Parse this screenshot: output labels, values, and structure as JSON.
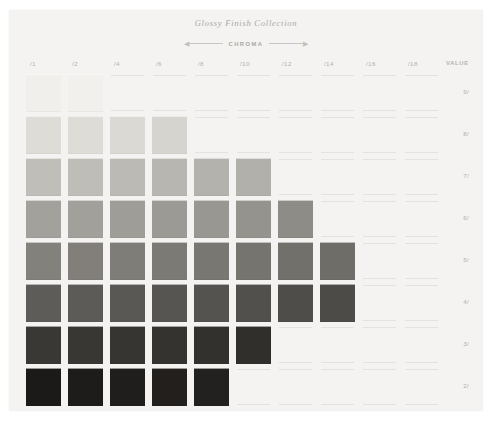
{
  "card": {
    "background": "#f4f3f1",
    "title": "Glossy Finish Collection"
  },
  "axis": {
    "chroma_label": "CHROMA",
    "arrow_left": "◀",
    "arrow_right": "▶"
  },
  "headers": {
    "value_header": "VALUE",
    "chroma_columns": [
      "/1",
      "/2",
      "/4",
      "/6",
      "/8",
      "/10",
      "/12",
      "/14",
      "/16",
      "/18"
    ]
  },
  "value_labels": [
    "9/",
    "8/",
    "7/",
    "6/",
    "5/",
    "4/",
    "3/",
    "2/"
  ],
  "chart_data": {
    "type": "heatmap",
    "title": "Glossy Finish Collection",
    "xlabel": "CHROMA",
    "ylabel": "VALUE",
    "categories": [
      "/1",
      "/2",
      "/4",
      "/6",
      "/8",
      "/10",
      "/12",
      "/14",
      "/16",
      "/18"
    ],
    "rows": [
      "9/",
      "8/",
      "7/",
      "6/",
      "5/",
      "4/",
      "3/",
      "2/"
    ],
    "grid": false,
    "legend": "none",
    "cells": [
      {
        "row": "9/",
        "col": "/1",
        "color": "#f0efeb"
      },
      {
        "row": "9/",
        "col": "/2",
        "color": "#f1f0ec"
      },
      {
        "row": "9/",
        "col": "/4",
        "color": null
      },
      {
        "row": "9/",
        "col": "/6",
        "color": null
      },
      {
        "row": "9/",
        "col": "/8",
        "color": null
      },
      {
        "row": "9/",
        "col": "/10",
        "color": null
      },
      {
        "row": "9/",
        "col": "/12",
        "color": null
      },
      {
        "row": "9/",
        "col": "/14",
        "color": null
      },
      {
        "row": "9/",
        "col": "/16",
        "color": null
      },
      {
        "row": "9/",
        "col": "/18",
        "color": null
      },
      {
        "row": "8/",
        "col": "/1",
        "color": "#dedcd7"
      },
      {
        "row": "8/",
        "col": "/2",
        "color": "#dedcd7"
      },
      {
        "row": "8/",
        "col": "/4",
        "color": "#dbd9d4"
      },
      {
        "row": "8/",
        "col": "/6",
        "color": "#d6d4cf"
      },
      {
        "row": "8/",
        "col": "/8",
        "color": null
      },
      {
        "row": "8/",
        "col": "/10",
        "color": null
      },
      {
        "row": "8/",
        "col": "/12",
        "color": null
      },
      {
        "row": "8/",
        "col": "/14",
        "color": null
      },
      {
        "row": "8/",
        "col": "/16",
        "color": null
      },
      {
        "row": "8/",
        "col": "/18",
        "color": null
      },
      {
        "row": "7/",
        "col": "/1",
        "color": "#c0beb9"
      },
      {
        "row": "7/",
        "col": "/2",
        "color": "#bfbdb8"
      },
      {
        "row": "7/",
        "col": "/4",
        "color": "#bcbab5"
      },
      {
        "row": "7/",
        "col": "/6",
        "color": "#b8b6b1"
      },
      {
        "row": "7/",
        "col": "/8",
        "color": "#b4b2ad"
      },
      {
        "row": "7/",
        "col": "/10",
        "color": "#b2b0ab"
      },
      {
        "row": "7/",
        "col": "/12",
        "color": null
      },
      {
        "row": "7/",
        "col": "/14",
        "color": null
      },
      {
        "row": "7/",
        "col": "/16",
        "color": null
      },
      {
        "row": "7/",
        "col": "/18",
        "color": null
      },
      {
        "row": "6/",
        "col": "/1",
        "color": "#a3a19c"
      },
      {
        "row": "6/",
        "col": "/2",
        "color": "#a2a09b"
      },
      {
        "row": "6/",
        "col": "/4",
        "color": "#9f9d98"
      },
      {
        "row": "6/",
        "col": "/6",
        "color": "#9c9a95"
      },
      {
        "row": "6/",
        "col": "/8",
        "color": "#999792"
      },
      {
        "row": "6/",
        "col": "/10",
        "color": "#95938e"
      },
      {
        "row": "6/",
        "col": "/12",
        "color": "#8e8c87"
      },
      {
        "row": "6/",
        "col": "/14",
        "color": null
      },
      {
        "row": "6/",
        "col": "/16",
        "color": null
      },
      {
        "row": "6/",
        "col": "/18",
        "color": null
      },
      {
        "row": "5/",
        "col": "/1",
        "color": "#83817c"
      },
      {
        "row": "5/",
        "col": "/2",
        "color": "#827f7b"
      },
      {
        "row": "5/",
        "col": "/4",
        "color": "#7f7d78"
      },
      {
        "row": "5/",
        "col": "/6",
        "color": "#7c7a75"
      },
      {
        "row": "5/",
        "col": "/8",
        "color": "#797772"
      },
      {
        "row": "5/",
        "col": "/10",
        "color": "#76746f"
      },
      {
        "row": "5/",
        "col": "/12",
        "color": "#72706b"
      },
      {
        "row": "5/",
        "col": "/14",
        "color": "#6f6d68"
      },
      {
        "row": "5/",
        "col": "/16",
        "color": null
      },
      {
        "row": "5/",
        "col": "/18",
        "color": null
      },
      {
        "row": "4/",
        "col": "/1",
        "color": "#5e5c58"
      },
      {
        "row": "4/",
        "col": "/2",
        "color": "#5d5b57"
      },
      {
        "row": "4/",
        "col": "/4",
        "color": "#5a5854"
      },
      {
        "row": "4/",
        "col": "/6",
        "color": "#575551"
      },
      {
        "row": "4/",
        "col": "/8",
        "color": "#55534f"
      },
      {
        "row": "4/",
        "col": "/10",
        "color": "#52504c"
      },
      {
        "row": "4/",
        "col": "/12",
        "color": "#4f4d49"
      },
      {
        "row": "4/",
        "col": "/14",
        "color": "#4d4b47"
      },
      {
        "row": "4/",
        "col": "/16",
        "color": null
      },
      {
        "row": "4/",
        "col": "/18",
        "color": null
      },
      {
        "row": "3/",
        "col": "/1",
        "color": "#3a3835"
      },
      {
        "row": "3/",
        "col": "/2",
        "color": "#393734"
      },
      {
        "row": "3/",
        "col": "/4",
        "color": "#373532"
      },
      {
        "row": "3/",
        "col": "/6",
        "color": "#353330"
      },
      {
        "row": "3/",
        "col": "/8",
        "color": "#33312e"
      },
      {
        "row": "3/",
        "col": "/10",
        "color": "#312f2c"
      },
      {
        "row": "3/",
        "col": "/12",
        "color": null
      },
      {
        "row": "3/",
        "col": "/14",
        "color": null
      },
      {
        "row": "3/",
        "col": "/16",
        "color": null
      },
      {
        "row": "3/",
        "col": "/18",
        "color": null
      },
      {
        "row": "2/",
        "col": "/1",
        "color": "#1c1a18"
      },
      {
        "row": "2/",
        "col": "/2",
        "color": "#1e1c1a"
      },
      {
        "row": "2/",
        "col": "/4",
        "color": "#201e1c"
      },
      {
        "row": "2/",
        "col": "/6",
        "color": "#221f1d"
      },
      {
        "row": "2/",
        "col": "/8",
        "color": "#232120"
      },
      {
        "row": "2/",
        "col": "/10",
        "color": null
      },
      {
        "row": "2/",
        "col": "/12",
        "color": null
      },
      {
        "row": "2/",
        "col": "/14",
        "color": null
      },
      {
        "row": "2/",
        "col": "/16",
        "color": null
      },
      {
        "row": "2/",
        "col": "/18",
        "color": null
      }
    ]
  }
}
